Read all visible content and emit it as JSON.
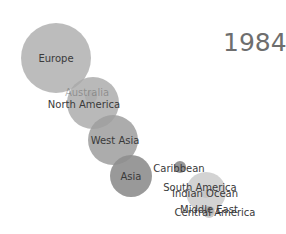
{
  "chart_data": {
    "type": "scatter",
    "subtype": "bubble",
    "title": "",
    "year_label": "1984",
    "xlabel": "",
    "ylabel": "",
    "grid": false,
    "legend": "none",
    "points": [
      {
        "name": "Europe",
        "cx": 56,
        "cy": 58,
        "r": 35,
        "color": "#b0b0b0",
        "opacity": 0.85,
        "label_x": 56,
        "label_y": 62
      },
      {
        "name": "Australia",
        "cx": 91,
        "cy": 97,
        "r": 6,
        "color": "#a8a8a8",
        "opacity": 0.6,
        "label_x": 87,
        "label_y": 96,
        "label_opacity": 0.35
      },
      {
        "name": "North America",
        "cx": 93,
        "cy": 103,
        "r": 26,
        "color": "#a8a8a8",
        "opacity": 0.8,
        "label_x": 84,
        "label_y": 108
      },
      {
        "name": "West Asia",
        "cx": 113,
        "cy": 140,
        "r": 25,
        "color": "#9d9d9d",
        "opacity": 0.85,
        "label_x": 115,
        "label_y": 144
      },
      {
        "name": "Asia",
        "cx": 131,
        "cy": 176,
        "r": 21,
        "color": "#8e8e8e",
        "opacity": 0.9,
        "label_x": 131,
        "label_y": 180
      },
      {
        "name": "Caribbean",
        "cx": 180,
        "cy": 167,
        "r": 6,
        "color": "#8a8a8a",
        "opacity": 0.9,
        "label_x": 179,
        "label_y": 172
      },
      {
        "name": "South America",
        "cx": 206,
        "cy": 192,
        "r": 20,
        "color": "#c4c4c4",
        "opacity": 0.75,
        "label_x": 200,
        "label_y": 191
      },
      {
        "name": "Indian Ocean",
        "cx": 206,
        "cy": 194,
        "r": 4,
        "color": "#bdbdbd",
        "opacity": 0.6,
        "label_x": 205,
        "label_y": 197
      },
      {
        "name": "Central America",
        "cx": 209,
        "cy": 212,
        "r": 6,
        "color": "#b5b5b5",
        "opacity": 0.7,
        "label_x": 215,
        "label_y": 216
      },
      {
        "name": "Middle East",
        "cx": 209,
        "cy": 211,
        "r": 5,
        "color": "#b0b0b0",
        "opacity": 0.7,
        "label_x": 209,
        "label_y": 213
      }
    ]
  }
}
